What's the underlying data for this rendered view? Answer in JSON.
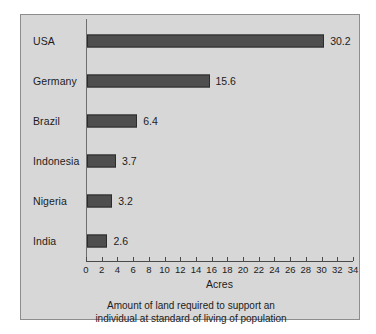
{
  "chart_data": {
    "type": "bar",
    "orientation": "horizontal",
    "title": "",
    "caption_line1": "Amount of land required to support an",
    "caption_line2": "individual at standard of living of population",
    "xlabel": "Acres",
    "ylabel": "",
    "categories": [
      "USA",
      "Germany",
      "Brazil",
      "Indonesia",
      "Nigeria",
      "India"
    ],
    "values": [
      30.2,
      15.6,
      6.4,
      3.7,
      3.2,
      2.6
    ],
    "value_labels": [
      "30.2",
      "15.6",
      "6.4",
      "3.7",
      "3.2",
      "2.6"
    ],
    "xlim": [
      0,
      34
    ],
    "xticks": [
      0,
      2,
      4,
      6,
      8,
      10,
      12,
      14,
      16,
      18,
      20,
      22,
      24,
      26,
      28,
      30,
      32,
      34
    ],
    "xtick_labels": [
      "0",
      "2",
      "4",
      "6",
      "8",
      "10",
      "12",
      "14",
      "16",
      "18",
      "20",
      "22",
      "24",
      "26",
      "28",
      "30",
      "32",
      "34"
    ],
    "grid": false,
    "legend": false,
    "bar_color": "#4e4e4e",
    "bar_edge_color": "#2b2b2b",
    "plot_background": "#d7d7d7",
    "axis_color": "#4a4a4a",
    "text_color": "#1c1c1c"
  }
}
